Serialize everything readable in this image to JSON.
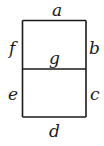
{
  "diagram": {
    "type": "seven-segment-display",
    "segments": [
      {
        "id": "a",
        "label": "a",
        "position": "top"
      },
      {
        "id": "b",
        "label": "b",
        "position": "upper-right"
      },
      {
        "id": "c",
        "label": "c",
        "position": "lower-right"
      },
      {
        "id": "d",
        "label": "d",
        "position": "bottom"
      },
      {
        "id": "e",
        "label": "e",
        "position": "lower-left"
      },
      {
        "id": "f",
        "label": "f",
        "position": "upper-left"
      },
      {
        "id": "g",
        "label": "g",
        "position": "middle"
      }
    ],
    "colors": {
      "stroke": "#1a1a1a",
      "background": "#ffffff"
    }
  }
}
